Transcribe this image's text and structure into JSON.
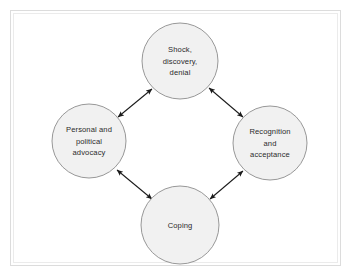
{
  "figure": {
    "type": "cycle-diagram",
    "title": "",
    "background_color": "#ffffff",
    "frame_color": "#dcdcdc",
    "node_fill_color": "#f1f1f1",
    "node_stroke_color": "#8c8c8c",
    "text_color": "#2b2b2b",
    "arrow_color": "#1a1a1a"
  },
  "nodes": [
    {
      "id": "shock",
      "position": "top",
      "lines": [
        "Shock,",
        "discovery,",
        "denial"
      ],
      "cx": 180,
      "cy": 61,
      "r": 38
    },
    {
      "id": "recognition",
      "position": "right",
      "lines": [
        "Recognition",
        "and",
        "acceptance"
      ],
      "cx": 270,
      "cy": 143,
      "r": 37
    },
    {
      "id": "coping",
      "position": "bottom",
      "lines": [
        "Coping"
      ],
      "cx": 180,
      "cy": 225,
      "r": 39
    },
    {
      "id": "advocacy",
      "position": "left",
      "lines": [
        "Personal and",
        "political",
        "advocacy"
      ],
      "cx": 89,
      "cy": 141,
      "r": 37
    }
  ],
  "connectors": [
    {
      "id": "advocacy-shock",
      "from": "advocacy",
      "to": "shock",
      "bidirectional": true
    },
    {
      "id": "shock-recognition",
      "from": "shock",
      "to": "recognition",
      "bidirectional": true
    },
    {
      "id": "recognition-coping",
      "from": "recognition",
      "to": "coping",
      "bidirectional": true
    },
    {
      "id": "coping-advocacy",
      "from": "coping",
      "to": "advocacy",
      "bidirectional": true
    }
  ]
}
